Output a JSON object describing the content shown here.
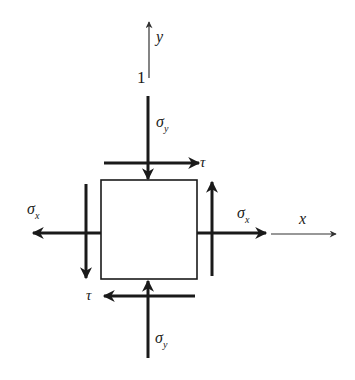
{
  "diagram": {
    "colors": {
      "stroke": "#1a1a1a",
      "axis": "#333333",
      "background": "#ffffff"
    },
    "axes": {
      "x": {
        "label": "x"
      },
      "y": {
        "label": "y"
      },
      "point_label": "1"
    },
    "element": {
      "shape": "square"
    },
    "stresses": {
      "sigma_x_left": {
        "symbol": "σ",
        "subscript": "x"
      },
      "sigma_x_right": {
        "symbol": "σ",
        "subscript": "x"
      },
      "sigma_y_top": {
        "symbol": "σ",
        "subscript": "y"
      },
      "sigma_y_bottom": {
        "symbol": "σ",
        "subscript": "y"
      },
      "tau_top": {
        "symbol": "τ"
      },
      "tau_bottom": {
        "symbol": "τ"
      }
    }
  }
}
